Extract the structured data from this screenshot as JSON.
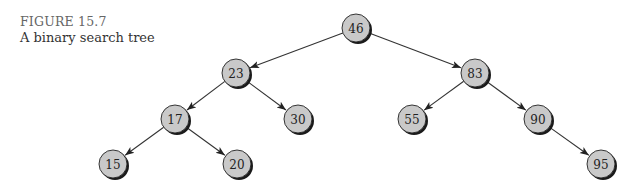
{
  "caption": {
    "figure_label": "FIGURE 15.7",
    "title": "A binary search tree"
  },
  "colors": {
    "node_fill": "#c9c9c9",
    "node_shadow": "#1a1a1a",
    "edge": "#333333",
    "caption_label": "#666666"
  },
  "tree": {
    "nodes": [
      {
        "id": "n46",
        "value": "46",
        "x": 356,
        "y": 28
      },
      {
        "id": "n23",
        "value": "23",
        "x": 236,
        "y": 73
      },
      {
        "id": "n83",
        "value": "83",
        "x": 475,
        "y": 73
      },
      {
        "id": "n17",
        "value": "17",
        "x": 175,
        "y": 119
      },
      {
        "id": "n30",
        "value": "30",
        "x": 298,
        "y": 119
      },
      {
        "id": "n55",
        "value": "55",
        "x": 412,
        "y": 119
      },
      {
        "id": "n90",
        "value": "90",
        "x": 538,
        "y": 119
      },
      {
        "id": "n15",
        "value": "15",
        "x": 113,
        "y": 164
      },
      {
        "id": "n20",
        "value": "20",
        "x": 237,
        "y": 164
      },
      {
        "id": "n95",
        "value": "95",
        "x": 601,
        "y": 164
      }
    ],
    "edges": [
      {
        "from": "n46",
        "to": "n23"
      },
      {
        "from": "n46",
        "to": "n83"
      },
      {
        "from": "n23",
        "to": "n17"
      },
      {
        "from": "n23",
        "to": "n30"
      },
      {
        "from": "n83",
        "to": "n55"
      },
      {
        "from": "n83",
        "to": "n90"
      },
      {
        "from": "n17",
        "to": "n15"
      },
      {
        "from": "n17",
        "to": "n20"
      },
      {
        "from": "n90",
        "to": "n95"
      }
    ]
  }
}
